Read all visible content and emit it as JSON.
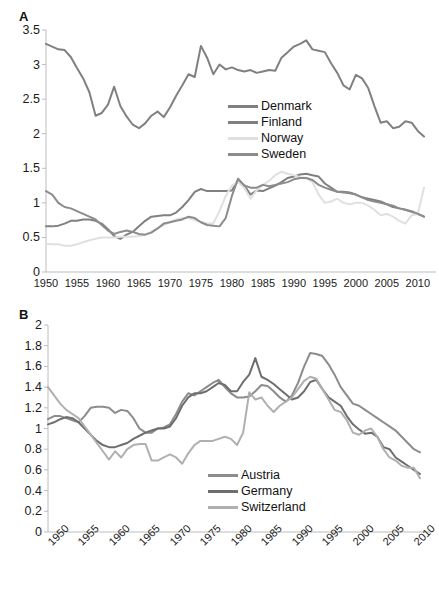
{
  "figure": {
    "panels": [
      {
        "id": "A",
        "label": "A",
        "legend_position": "center-right-inside",
        "xtick_rotation": 0
      },
      {
        "id": "B",
        "label": "B",
        "legend_position": "center-right-inside",
        "xtick_rotation": -45
      }
    ]
  },
  "chart_data": [
    {
      "type": "line",
      "title": "A",
      "xlabel": "",
      "ylabel": "",
      "xlim": [
        1950,
        2011
      ],
      "ylim": [
        0,
        3.5
      ],
      "ytick_labels": [
        "0",
        "0.5",
        "1",
        "1.5",
        "2",
        "2.5",
        "3",
        "3.5"
      ],
      "ytick_values": [
        0,
        0.5,
        1,
        1.5,
        2,
        2.5,
        3,
        3.5
      ],
      "xtick_labels": [
        "1950",
        "1955",
        "1960",
        "1965",
        "1970",
        "1975",
        "1980",
        "1985",
        "1990",
        "1995",
        "2000",
        "2005",
        "2010"
      ],
      "xtick_values": [
        1950,
        1955,
        1960,
        1965,
        1970,
        1975,
        1980,
        1985,
        1990,
        1995,
        2000,
        2005,
        2010
      ],
      "grid": false,
      "legend_position": "inside-center-right",
      "x": [
        1950,
        1951,
        1952,
        1953,
        1954,
        1955,
        1956,
        1957,
        1958,
        1959,
        1960,
        1961,
        1962,
        1963,
        1964,
        1965,
        1966,
        1967,
        1968,
        1969,
        1970,
        1971,
        1972,
        1973,
        1974,
        1975,
        1976,
        1977,
        1978,
        1979,
        1980,
        1981,
        1982,
        1983,
        1984,
        1985,
        1986,
        1987,
        1988,
        1989,
        1990,
        1991,
        1992,
        1993,
        1994,
        1995,
        1996,
        1997,
        1998,
        1999,
        2000,
        2001,
        2002,
        2003,
        2004,
        2005,
        2006,
        2007,
        2008,
        2009,
        2010,
        2011
      ],
      "series": [
        {
          "name": "Denmark",
          "color": "#808080",
          "values": [
            3.3,
            3.26,
            3.22,
            3.21,
            3.11,
            2.95,
            2.8,
            2.6,
            2.26,
            2.3,
            2.42,
            2.68,
            2.4,
            2.25,
            2.13,
            2.08,
            2.15,
            2.26,
            2.32,
            2.24,
            2.38,
            2.55,
            2.7,
            2.86,
            2.82,
            3.27,
            3.1,
            2.86,
            3.0,
            2.93,
            2.96,
            2.92,
            2.9,
            2.92,
            2.88,
            2.9,
            2.92,
            2.91,
            3.1,
            3.18,
            3.26,
            3.3,
            3.35,
            3.22,
            3.2,
            3.18,
            3.02,
            2.88,
            2.7,
            2.64,
            2.85,
            2.8,
            2.66,
            2.4,
            2.16,
            2.18,
            2.08,
            2.1,
            2.18,
            2.16,
            2.04,
            1.96
          ]
        },
        {
          "name": "Finland",
          "color": "#808080",
          "values": [
            0.66,
            0.66,
            0.67,
            0.7,
            0.74,
            0.74,
            0.76,
            0.76,
            0.74,
            0.7,
            0.62,
            0.52,
            0.48,
            0.54,
            0.58,
            0.66,
            0.74,
            0.8,
            0.81,
            0.82,
            0.82,
            0.86,
            0.94,
            1.04,
            1.16,
            1.2,
            1.17,
            1.17,
            1.17,
            1.17,
            1.18,
            1.33,
            1.25,
            1.12,
            1.18,
            1.17,
            1.21,
            1.25,
            1.3,
            1.36,
            1.38,
            1.41,
            1.42,
            1.4,
            1.38,
            1.28,
            1.22,
            1.16,
            1.16,
            1.15,
            1.12,
            1.08,
            1.06,
            1.04,
            1.02,
            0.98,
            0.94,
            0.92,
            0.9,
            0.87,
            0.84,
            0.8
          ]
        },
        {
          "name": "Norway",
          "color": "#e0e0e0",
          "values": [
            0.41,
            0.4,
            0.4,
            0.38,
            0.38,
            0.4,
            0.43,
            0.46,
            0.48,
            0.5,
            0.5,
            0.5,
            0.51,
            0.51,
            0.51,
            0.52,
            0.54,
            0.58,
            0.63,
            0.68,
            0.72,
            0.76,
            0.78,
            0.78,
            0.75,
            0.72,
            0.7,
            0.7,
            0.88,
            1.1,
            1.25,
            1.3,
            1.22,
            1.06,
            1.18,
            1.26,
            1.32,
            1.4,
            1.45,
            1.42,
            1.4,
            1.37,
            1.36,
            1.3,
            1.12,
            1.0,
            1.02,
            1.06,
            1.0,
            0.98,
            1.0,
            1.0,
            0.96,
            0.9,
            0.82,
            0.84,
            0.8,
            0.74,
            0.7,
            0.82,
            0.84,
            1.22
          ]
        },
        {
          "name": "Sweden",
          "color": "#8c8c8c",
          "values": [
            1.17,
            1.12,
            1.0,
            0.94,
            0.92,
            0.88,
            0.84,
            0.8,
            0.76,
            0.68,
            0.6,
            0.55,
            0.58,
            0.6,
            0.58,
            0.55,
            0.54,
            0.57,
            0.63,
            0.7,
            0.72,
            0.74,
            0.76,
            0.8,
            0.78,
            0.72,
            0.68,
            0.67,
            0.66,
            0.78,
            1.1,
            1.35,
            1.25,
            1.22,
            1.22,
            1.26,
            1.24,
            1.26,
            1.28,
            1.3,
            1.34,
            1.36,
            1.36,
            1.33,
            1.26,
            1.22,
            1.19,
            1.16,
            1.15,
            1.14,
            1.12,
            1.08,
            1.04,
            1.02,
            1.0,
            0.98,
            0.96,
            0.92,
            0.9,
            0.88,
            0.84,
            0.8
          ]
        }
      ]
    },
    {
      "type": "line",
      "title": "B",
      "xlabel": "",
      "ylabel": "",
      "xlim": [
        1950,
        2011
      ],
      "ylim": [
        0,
        2
      ],
      "ytick_labels": [
        "0",
        "0.2",
        "0.4",
        "0.6",
        "0.8",
        "1",
        "1.2",
        "1.4",
        "1.6",
        "1.8",
        "2"
      ],
      "ytick_values": [
        0,
        0.2,
        0.4,
        0.6,
        0.8,
        1,
        1.2,
        1.4,
        1.6,
        1.8,
        2
      ],
      "xtick_labels": [
        "1950",
        "1955",
        "1960",
        "1965",
        "1970",
        "1975",
        "1980",
        "1985",
        "1990",
        "1995",
        "2000",
        "2005",
        "2010"
      ],
      "xtick_values": [
        1950,
        1955,
        1960,
        1965,
        1970,
        1975,
        1980,
        1985,
        1990,
        1995,
        2000,
        2005,
        2010
      ],
      "grid": false,
      "legend_position": "inside-center-right",
      "x": [
        1950,
        1951,
        1952,
        1953,
        1954,
        1955,
        1956,
        1957,
        1958,
        1959,
        1960,
        1961,
        1962,
        1963,
        1964,
        1965,
        1966,
        1967,
        1968,
        1969,
        1970,
        1971,
        1972,
        1973,
        1974,
        1975,
        1976,
        1977,
        1978,
        1979,
        1980,
        1981,
        1982,
        1983,
        1984,
        1985,
        1986,
        1987,
        1988,
        1989,
        1990,
        1991,
        1992,
        1993,
        1994,
        1995,
        1996,
        1997,
        1998,
        1999,
        2000,
        2001,
        2002,
        2003,
        2004,
        2005,
        2006,
        2007,
        2008,
        2009,
        2010,
        2011
      ],
      "series": [
        {
          "name": "Austria",
          "color": "#8c8c8c",
          "values": [
            1.09,
            1.12,
            1.12,
            1.1,
            1.08,
            1.06,
            1.12,
            1.2,
            1.21,
            1.21,
            1.2,
            1.15,
            1.18,
            1.17,
            1.1,
            1.0,
            0.96,
            0.96,
            1.0,
            1.01,
            1.04,
            1.14,
            1.26,
            1.34,
            1.32,
            1.36,
            1.4,
            1.44,
            1.47,
            1.4,
            1.34,
            1.3,
            1.3,
            1.31,
            1.36,
            1.42,
            1.41,
            1.36,
            1.3,
            1.26,
            1.32,
            1.44,
            1.6,
            1.73,
            1.72,
            1.7,
            1.62,
            1.52,
            1.4,
            1.32,
            1.24,
            1.22,
            1.18,
            1.14,
            1.1,
            1.06,
            1.02,
            0.98,
            0.92,
            0.86,
            0.8,
            0.77
          ]
        },
        {
          "name": "Germany",
          "color": "#6e6e6e",
          "values": [
            1.04,
            1.06,
            1.09,
            1.11,
            1.1,
            1.06,
            1.0,
            0.94,
            0.88,
            0.84,
            0.82,
            0.82,
            0.84,
            0.86,
            0.9,
            0.93,
            0.96,
            0.98,
            1.0,
            1.0,
            1.02,
            1.1,
            1.22,
            1.3,
            1.34,
            1.34,
            1.36,
            1.4,
            1.44,
            1.42,
            1.36,
            1.36,
            1.45,
            1.52,
            1.68,
            1.5,
            1.47,
            1.43,
            1.38,
            1.33,
            1.28,
            1.3,
            1.36,
            1.45,
            1.47,
            1.38,
            1.3,
            1.26,
            1.22,
            1.12,
            1.04,
            0.99,
            0.95,
            0.96,
            0.92,
            0.82,
            0.8,
            0.72,
            0.68,
            0.64,
            0.6,
            0.56
          ]
        },
        {
          "name": "Switzerland",
          "color": "#b0b0b0",
          "values": [
            1.4,
            1.32,
            1.24,
            1.18,
            1.14,
            1.1,
            1.02,
            0.94,
            0.86,
            0.78,
            0.7,
            0.78,
            0.72,
            0.8,
            0.84,
            0.85,
            0.85,
            0.69,
            0.69,
            0.72,
            0.75,
            0.72,
            0.66,
            0.76,
            0.84,
            0.88,
            0.88,
            0.88,
            0.9,
            0.92,
            0.9,
            0.84,
            0.96,
            1.35,
            1.28,
            1.3,
            1.22,
            1.16,
            1.22,
            1.26,
            1.3,
            1.38,
            1.46,
            1.5,
            1.48,
            1.38,
            1.28,
            1.18,
            1.16,
            1.08,
            0.96,
            0.94,
            0.98,
            1.0,
            0.92,
            0.8,
            0.72,
            0.69,
            0.64,
            0.62,
            0.62,
            0.52
          ]
        }
      ]
    }
  ]
}
